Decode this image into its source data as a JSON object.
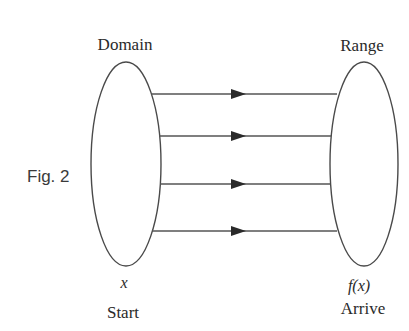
{
  "figure": {
    "label": "Fig. 2",
    "domain_title": "Domain",
    "range_title": "Range",
    "domain_variable": "x",
    "range_variable": "f(x)",
    "domain_caption": "Start",
    "range_caption": "Arrive",
    "arrow_count": 4,
    "colors": {
      "stroke": "#4a4a4a",
      "arrowhead": "#2a2a2a",
      "text": "#2a2a2a"
    }
  }
}
